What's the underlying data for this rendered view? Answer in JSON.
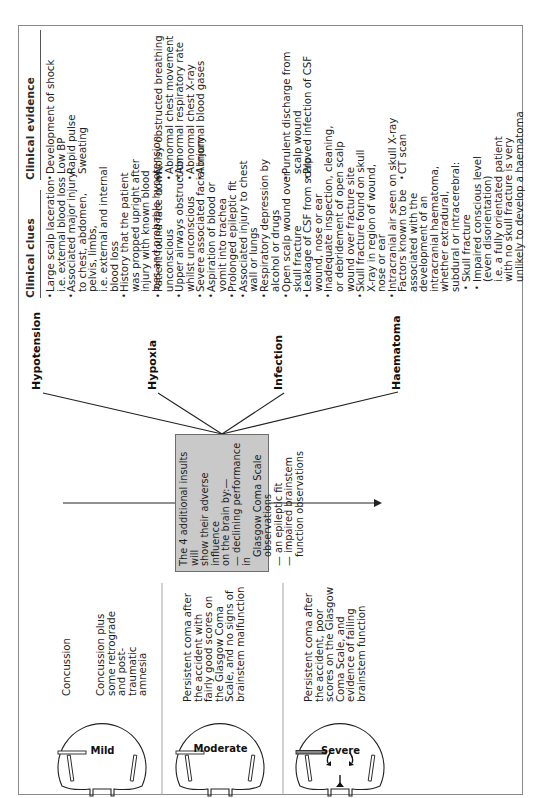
{
  "headers": {
    "clinical_clues": "Clinical clues",
    "clinical_evidence": "Clinical evidence"
  },
  "severity": [
    {
      "label": "Mild",
      "descriptions": [
        "Concussion",
        "Concussion plus some retrograde and post-traumatic amnesia"
      ]
    },
    {
      "label": "Moderate",
      "descriptions": [
        "Persistent coma after the accident with fairly good scores on the Glasgow Coma Scale, and no signs of brainstem malfunction"
      ]
    },
    {
      "label": "Severe",
      "descriptions": [
        "Persistent coma after the accident, poor scores on the Glasgow Coma Scale, and evidence of failing brainstem function"
      ]
    }
  ],
  "central_box": {
    "intro_lines": [
      "The 4 additional insults will",
      "show their adverse influence",
      "on the brain by:—"
    ],
    "items": [
      [
        "— declining performance in",
        "Glasgow Coma Scale",
        "observations"
      ],
      [
        "— an epileptic fit"
      ],
      [
        "— impaired brainstem",
        "function observations"
      ]
    ]
  },
  "insults": [
    {
      "name": "Hypotension",
      "clues": [
        {
          "bullet": true,
          "lines": [
            "Large scalp laceration",
            "i.e. external blood loss"
          ]
        },
        {
          "bullet": true,
          "lines": [
            "Associated major injury",
            "to chest, abdomen,",
            "pelvis, limbs,",
            "i.e. external and internal",
            "blood loss"
          ]
        },
        {
          "bullet": true,
          "lines": [
            "History that the patient",
            "was propped upright after",
            "injury with known blood",
            "loss and probable hypotension"
          ]
        }
      ],
      "evidence": [
        {
          "bullet": true,
          "lines": [
            "Development of shock"
          ]
        },
        {
          "bullet": false,
          "lines": [
            "Low BP"
          ]
        },
        {
          "bullet": false,
          "lines": [
            "Rapid pulse"
          ]
        },
        {
          "bullet": false,
          "lines": [
            "Sweating"
          ]
        }
      ]
    },
    {
      "name": "Hypoxia",
      "clues": [
        {
          "bullet": true,
          "lines": [
            "Patient found face down,",
            "unconscious"
          ]
        },
        {
          "bullet": true,
          "lines": [
            "Upper airways obstruction",
            "whilst unconscious"
          ]
        },
        {
          "bullet": true,
          "lines": [
            "Severe associated facial injury"
          ]
        },
        {
          "bullet": true,
          "lines": [
            "Aspiration of blood or",
            "vomit into trachea"
          ]
        },
        {
          "bullet": true,
          "lines": [
            "Prolonged epileptic fit"
          ]
        },
        {
          "bullet": true,
          "lines": [
            "Associated injury to chest",
            "wall or lungs"
          ]
        },
        {
          "bullet": true,
          "lines": [
            "Respiratory depression by",
            "alcohol or drugs"
          ]
        }
      ],
      "evidence": [
        {
          "bullet": true,
          "lines": [
            "Noisy obstructed breathing"
          ]
        },
        {
          "bullet": true,
          "lines": [
            "Abnormal chest movement"
          ]
        },
        {
          "bullet": true,
          "lines": [
            "Abnormal respiratory rate"
          ]
        },
        {
          "bullet": true,
          "lines": [
            "Abnormal chest X-ray"
          ]
        },
        {
          "bullet": true,
          "lines": [
            "Abnormal blood gases"
          ]
        }
      ]
    },
    {
      "name": "Infection",
      "clues": [
        {
          "bullet": true,
          "lines": [
            "Open scalp wound over",
            "skull fracture"
          ]
        },
        {
          "bullet": true,
          "lines": [
            "Leakage of CSF from scalp",
            "wound, nose or ear"
          ]
        },
        {
          "bullet": true,
          "lines": [
            "Inadequate inspection, cleaning,",
            "or debridement of open scalp",
            "wound over fracture site"
          ]
        },
        {
          "bullet": true,
          "lines": [
            "Skull fracture found on skull",
            "X-ray in region of wound,",
            "nose or ear"
          ]
        },
        {
          "bullet": true,
          "lines": [
            "Intracranial air seen on skull X-ray"
          ]
        }
      ],
      "evidence": [
        {
          "bullet": true,
          "lines": [
            "Purulent discharge from",
            "scalp wound"
          ]
        },
        {
          "bullet": true,
          "lines": [
            "Proved infection of CSF"
          ]
        }
      ]
    },
    {
      "name": "Haematoma",
      "clues_intro": [
        "Factors known to be",
        "associated with the",
        "development of an",
        "intracranial haematoma,",
        "whether extradural,",
        "subdural or intracerebral:"
      ],
      "clues": [
        {
          "bullet": true,
          "lines": [
            "Skull fracture"
          ]
        },
        {
          "bullet": true,
          "lines": [
            "Impaired conscious level",
            "(even disorientation)",
            "i.e. a fully orientated patient",
            "with no skull fracture is very",
            "unlikely to develop a haematoma"
          ]
        }
      ],
      "evidence": [
        {
          "bullet": true,
          "lines": [
            "CT scan"
          ]
        }
      ]
    }
  ]
}
